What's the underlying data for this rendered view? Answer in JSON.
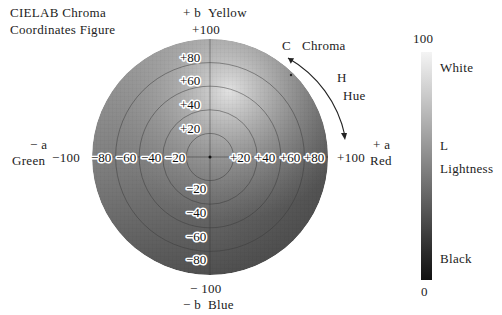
{
  "title": {
    "line1": "CIELAB Chroma",
    "line2": "Coordinates Figure"
  },
  "axes": {
    "top": {
      "sign": "+ b",
      "name": "Yellow",
      "max": "+100"
    },
    "bottom": {
      "sign": "− b",
      "name": "Blue",
      "max": "− 100"
    },
    "left": {
      "sign": "− a",
      "name": "Green",
      "max": "−100"
    },
    "right": {
      "sign": "+ a",
      "name": "Red",
      "max": "+100"
    }
  },
  "ticks": {
    "b_positive": [
      "+80",
      "+60",
      "+40",
      "+20"
    ],
    "b_negative": [
      "−20",
      "−40",
      "−60",
      "−80"
    ],
    "a_negative": [
      "−80",
      "−60",
      "−40",
      "−20"
    ],
    "a_positive": [
      "+20",
      "+40",
      "+60",
      "+80"
    ]
  },
  "annotations": {
    "chroma_letter": "C",
    "chroma_label": "Chroma",
    "hue_letter": "H",
    "hue_label": "Hue"
  },
  "lightness": {
    "max": "100",
    "min": "0",
    "top_label": "White",
    "letter": "L",
    "label": "Lightness",
    "bottom_label": "Black"
  },
  "colors": {
    "wheel_light": "#d8d8d8",
    "wheel_mid": "#8a8a8a",
    "wheel_dark": "#4a4a4a",
    "ring": "#3a3a3a"
  }
}
